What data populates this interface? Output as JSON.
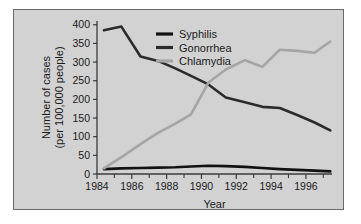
{
  "figure": {
    "background_color": "#d2d2d2",
    "border_color": "#6a6a6a",
    "page_background": "#ffffff"
  },
  "axes": {
    "x_title": "Year",
    "y_title_line1": "Number of cases",
    "y_title_line2": "(per 100,000 people)",
    "x_tick_labels": [
      "1984",
      "1986",
      "1988",
      "1990",
      "1992",
      "1994",
      "1996"
    ],
    "y_tick_labels": [
      "0",
      "50",
      "100",
      "150",
      "200",
      "250",
      "300",
      "350",
      "400"
    ]
  },
  "legend": {
    "items": [
      {
        "label": "Syphilis",
        "color": "#111111"
      },
      {
        "label": "Gonorrhea",
        "color": "#2b2b2b"
      },
      {
        "label": "Chlamydia",
        "color": "#a5a5a5"
      }
    ]
  },
  "chart_data": {
    "type": "line",
    "title": "",
    "xlabel": "Year",
    "ylabel": "Number of cases (per 100,000 people)",
    "xlim": [
      1984,
      1997.5
    ],
    "ylim": [
      0,
      410
    ],
    "xticks": [
      1984,
      1986,
      1988,
      1990,
      1992,
      1994,
      1996
    ],
    "xminorticks": [
      1985,
      1987,
      1989,
      1991,
      1993,
      1995,
      1997
    ],
    "yticks": [
      0,
      50,
      100,
      150,
      200,
      250,
      300,
      350,
      400
    ],
    "grid": false,
    "legend_position": "top-center",
    "series": [
      {
        "name": "Syphilis",
        "color": "#111111",
        "x": [
          1984.4,
          1985.4,
          1986.5,
          1987.5,
          1988.5,
          1989.4,
          1990.4,
          1991.4,
          1992.5,
          1993.5,
          1994.5,
          1995.5,
          1996.5,
          1997.4
        ],
        "values": [
          13,
          15,
          16,
          17,
          18,
          20,
          22,
          21,
          19,
          16,
          13,
          11,
          9,
          7
        ]
      },
      {
        "name": "Gonorrhea",
        "color": "#2b2b2b",
        "x": [
          1984.4,
          1985.4,
          1986.5,
          1987.5,
          1988.5,
          1989.4,
          1990.4,
          1991.4,
          1992.5,
          1993.5,
          1994.5,
          1995.5,
          1996.5,
          1997.4
        ],
        "values": [
          385,
          395,
          315,
          303,
          283,
          263,
          240,
          205,
          192,
          180,
          177,
          158,
          138,
          117
        ]
      },
      {
        "name": "Chlamydia",
        "color": "#a5a5a5",
        "x": [
          1984.4,
          1985.4,
          1986.5,
          1987.5,
          1988.5,
          1989.4,
          1990.4,
          1991.4,
          1992.5,
          1993.5,
          1994.5,
          1995.5,
          1996.5,
          1997.4
        ],
        "values": [
          15,
          45,
          80,
          110,
          135,
          160,
          245,
          280,
          305,
          287,
          333,
          330,
          325,
          355
        ]
      }
    ]
  }
}
